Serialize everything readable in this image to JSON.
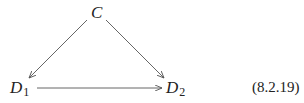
{
  "diagram": {
    "type": "commutative-diagram",
    "nodes": {
      "top": {
        "letter": "C",
        "subscript": ""
      },
      "bottom_left": {
        "letter": "D",
        "subscript": "1"
      },
      "bottom_right": {
        "letter": "D",
        "subscript": "2"
      }
    },
    "edges": [
      {
        "from": "C",
        "to": "D1"
      },
      {
        "from": "C",
        "to": "D2"
      },
      {
        "from": "D1",
        "to": "D2"
      }
    ],
    "equation_label": "(8.2.19)",
    "colors": {
      "text": "#222222",
      "arrow": "#555555",
      "background": "#ffffff"
    }
  }
}
